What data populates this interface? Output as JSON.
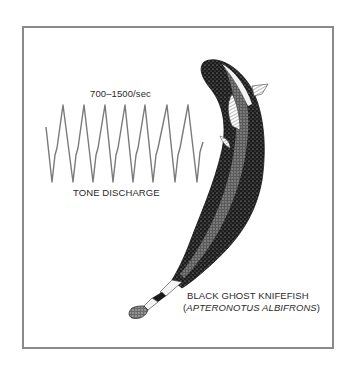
{
  "figure": {
    "rate_label": "700–1500/sec",
    "waveform_label": "TONE DISCHARGE",
    "species_common_name": "BLACK GHOST KNIFEFISH",
    "species_scientific_name_open": "(",
    "species_scientific_name": "APTERONOTUS ALBIFRONS",
    "species_scientific_name_close": ")",
    "waveform_color": "#7a7a7a",
    "frame_color": "#8a8a8a",
    "illustration": "black-ghost-knifefish-drawing"
  }
}
